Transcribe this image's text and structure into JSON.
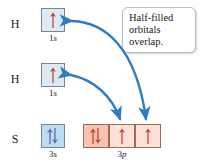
{
  "figure": {
    "type": "orbital-box-diagram",
    "background_color": "#ffffff",
    "accent_arrow_color": "#2e7cc4",
    "spin_arrow_color_blue": "#5b5fa8",
    "spin_arrow_color_red": "#c0392b"
  },
  "rows": [
    {
      "id": "hydrogen-1",
      "element_label": "H",
      "boxes": [
        {
          "subshell": "1s",
          "fill": "#dceaf5",
          "electrons": "up",
          "half_filled": true
        }
      ]
    },
    {
      "id": "hydrogen-2",
      "element_label": "H",
      "boxes": [
        {
          "subshell": "1s",
          "fill": "#dceaf5",
          "electrons": "up",
          "half_filled": true
        }
      ]
    },
    {
      "id": "sulfur",
      "element_label": "S",
      "boxes": [
        {
          "subshell": "3s",
          "fill": "#bcdcef",
          "electrons": "up-down",
          "half_filled": false
        },
        {
          "subshell": "3p",
          "fill": "#f7c3ae",
          "electrons": "up-down",
          "half_filled": false
        },
        {
          "subshell": "3p",
          "fill": "#fde1d6",
          "electrons": "up",
          "half_filled": true
        },
        {
          "subshell": "3p",
          "fill": "#fde1d6",
          "electrons": "up",
          "half_filled": true
        }
      ]
    }
  ],
  "subshell_captions": {
    "h1": {
      "n": "1",
      "letter": "s"
    },
    "h2": {
      "n": "1",
      "letter": "s"
    },
    "s_3s": {
      "n": "3",
      "letter": "s"
    },
    "s_3p": {
      "n": "3",
      "letter": "p"
    }
  },
  "callout": {
    "lines": [
      "Half-filled",
      "orbitals",
      "overlap."
    ],
    "full_text": "Half-filled orbitals overlap."
  },
  "overlap_arrows": [
    {
      "id": "arrow-h1-to-3p3",
      "from": "hydrogen-1 1s box",
      "to": "sulfur 3p third box",
      "double_headed": true,
      "color": "#2e7cc4"
    },
    {
      "id": "arrow-h2-to-3p2",
      "from": "hydrogen-2 1s box",
      "to": "sulfur 3p second box",
      "double_headed": true,
      "color": "#2e7cc4"
    }
  ]
}
